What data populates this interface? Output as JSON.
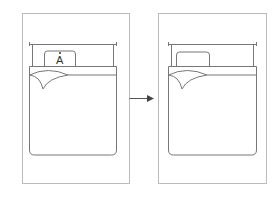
{
  "diagram": {
    "type": "before-after bed illustration",
    "panels": [
      {
        "id": "before",
        "pillow_label": "A",
        "has_label": true
      },
      {
        "id": "after",
        "pillow_label": "",
        "has_label": false
      }
    ],
    "arrow": {
      "direction": "right",
      "color": "#444444"
    },
    "colors": {
      "stroke": "#777777",
      "frame": "#bbbbbb",
      "background": "#ffffff"
    }
  }
}
